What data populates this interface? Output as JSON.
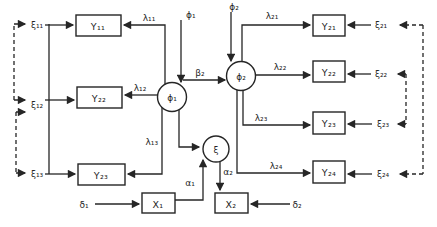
{
  "diagram": {
    "type": "structural-equation-path-diagram",
    "background_color": "#ffffff",
    "ink_color": "#262626",
    "latent": {
      "phi1": "ϕ₁",
      "phi2": "ϕ₂",
      "xi": "ξ"
    },
    "observed": {
      "y11": "Y₁₁",
      "y22_left": "Y₂₂",
      "y23_left": "Y₂₃",
      "y21": "Y₂₁",
      "y22_right": "Y₂₂",
      "y23_right": "Y₂₃",
      "y24": "Y₂₄",
      "x1": "X₁",
      "x2": "X₂"
    },
    "exogenous_inputs": {
      "phi1_top": "ϕ₁",
      "phi2_top": "ϕ₂"
    },
    "loadings": {
      "lambda11": "λ₁₁",
      "lambda12": "λ₁₂",
      "lambda13": "λ₁₃",
      "lambda21": "λ₂₁",
      "lambda22": "λ₂₂",
      "lambda23": "λ₂₃",
      "lambda24": "λ₂₄"
    },
    "errors": {
      "xi11": "ξ₁₁",
      "xi12": "ξ₁₂",
      "xi13": "ξ₁₃",
      "xi21": "ξ₂₁",
      "xi22": "ξ₂₂",
      "xi23": "ξ₂₃",
      "xi24": "ξ₂₄",
      "delta1": "δ₁",
      "delta2": "δ₂"
    },
    "structural": {
      "beta2": "β₂",
      "alpha1": "α₁",
      "alpha2": "α₂"
    }
  }
}
